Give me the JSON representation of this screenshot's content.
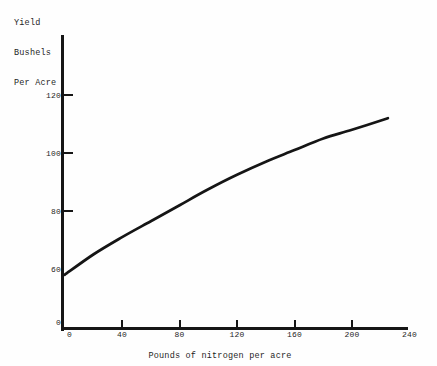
{
  "colors": {
    "ink": "#1e1e1e",
    "axis": "#161616",
    "curve": "#151515",
    "background": "#fefefe"
  },
  "figure": {
    "y_axis_title_lines": [
      "Yield",
      "Bushels",
      "Per Acre"
    ]
  },
  "chart_data": {
    "type": "line",
    "title": "",
    "xlabel": "Pounds of nitrogen per acre",
    "ylabel": "Yield Bushels Per Acre",
    "x_range": [
      0,
      240
    ],
    "y_range_shown": [
      0,
      130
    ],
    "y_axis_break_at_zero": true,
    "grid": false,
    "legend": "none",
    "x_ticks": [
      {
        "label": "0",
        "value": 0,
        "mark": false
      },
      {
        "label": "40",
        "value": 40,
        "mark": true
      },
      {
        "label": "80",
        "value": 80,
        "mark": true
      },
      {
        "label": "120",
        "value": 120,
        "mark": true
      },
      {
        "label": "160",
        "value": 160,
        "mark": true
      },
      {
        "label": "200",
        "value": 200,
        "mark": true
      },
      {
        "label": "240",
        "value": 240,
        "mark": false
      }
    ],
    "y_ticks": [
      {
        "label": "120",
        "value": 120,
        "mark": true
      },
      {
        "label": "100",
        "value": 100,
        "mark": true
      },
      {
        "label": "80",
        "value": 80,
        "mark": true
      },
      {
        "label": "60",
        "value": 60,
        "mark": false
      },
      {
        "label": "0",
        "value": 0,
        "mark": false
      }
    ],
    "series": [
      {
        "name": "yield-response-to-nitrogen",
        "x": [
          0,
          20,
          40,
          60,
          80,
          100,
          120,
          140,
          160,
          180,
          200,
          225
        ],
        "y": [
          58,
          65,
          71,
          76.5,
          82,
          87.5,
          92.5,
          97,
          101,
          105,
          108,
          112
        ]
      }
    ]
  }
}
